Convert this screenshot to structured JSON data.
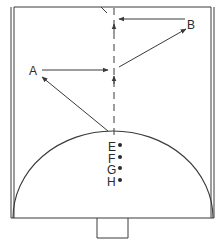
{
  "diagram": {
    "labels": {
      "A": "A",
      "B": "B",
      "E": "E",
      "F": "F",
      "G": "G",
      "H": "H"
    },
    "points": [
      {
        "id": "E",
        "label": "E",
        "y": 146
      },
      {
        "id": "F",
        "label": "F",
        "y": 157
      },
      {
        "id": "G",
        "label": "G",
        "y": 168
      },
      {
        "id": "H",
        "label": "H",
        "y": 181
      }
    ],
    "colors": {
      "stroke": "#3a3a3a",
      "background": "#ffffff"
    }
  }
}
